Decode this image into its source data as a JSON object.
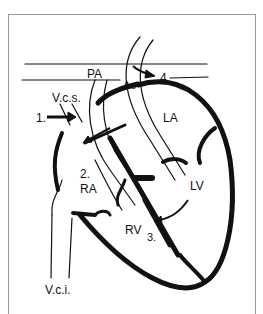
{
  "diagram": {
    "type": "heart-anatomy-cross-section",
    "labels": {
      "pa": "PA",
      "ao": "Ao",
      "vcs": "V.c.s.",
      "la": "LA",
      "ra": "RA",
      "lv": "LV",
      "rv": "RV",
      "vci": "V.c.i."
    },
    "markers": {
      "m1": "1.",
      "m2": "2.",
      "m3": "3.",
      "m4": "4."
    },
    "colors": {
      "ink": "#111111",
      "frame": "#9a9a9a",
      "background": "#ffffff"
    }
  }
}
